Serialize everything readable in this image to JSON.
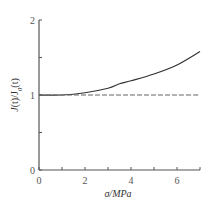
{
  "chart_data": {
    "type": "line",
    "title": "",
    "xlabel": "σ/MPa",
    "ylabel": "J(t)/J0(t)",
    "xlim": [
      0,
      7
    ],
    "ylim": [
      0,
      2
    ],
    "x_ticks": [
      0,
      1,
      2,
      3,
      4,
      5,
      6,
      7
    ],
    "x_tick_labels": [
      "0",
      "2",
      "4",
      "6"
    ],
    "x_tick_label_values": [
      0,
      2,
      4,
      6
    ],
    "y_ticks": [
      0,
      0.5,
      1,
      1.5,
      2
    ],
    "y_tick_labels": [
      "0",
      "1",
      "2"
    ],
    "y_tick_label_values": [
      0,
      1,
      2
    ],
    "grid": false,
    "legend": null,
    "series": [
      {
        "name": "solid",
        "style": "solid",
        "color": "#333333",
        "x": [
          0,
          1,
          2,
          3,
          3.5,
          4,
          5,
          6,
          7
        ],
        "values": [
          1.0,
          1.0,
          1.03,
          1.09,
          1.15,
          1.19,
          1.28,
          1.4,
          1.58
        ]
      },
      {
        "name": "dashed",
        "style": "dashed",
        "color": "#666666",
        "x": [
          0,
          1,
          2,
          3,
          4,
          5,
          6,
          7
        ],
        "values": [
          1.0,
          1.0,
          1.0,
          1.0,
          1.0,
          1.0,
          1.0,
          1.0
        ]
      }
    ]
  },
  "labels": {
    "x_axis": "σ/MPa",
    "y_axis_J": "J",
    "y_axis_rest": "(t)/J",
    "y_axis_sub": "0",
    "y_axis_end": "(t)"
  }
}
